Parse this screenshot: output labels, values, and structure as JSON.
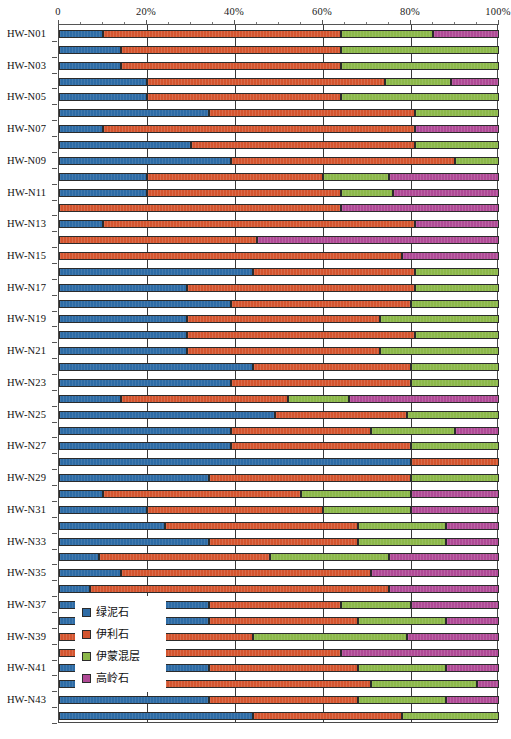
{
  "chart_data": {
    "type": "bar",
    "orientation": "horizontal",
    "stacked": true,
    "stacked_normalized": true,
    "title": "",
    "xlabel": "",
    "ylabel": "",
    "xlim": [
      0,
      100
    ],
    "grid": true,
    "legend_position": "inside-bottom-left",
    "x_tick_labels": [
      "0",
      "20%",
      "40%",
      "60%",
      "80%",
      "100%"
    ],
    "x_tick_values": [
      0,
      20,
      40,
      60,
      80,
      100
    ],
    "x_minor_tick_values": [
      5,
      10,
      15,
      25,
      30,
      35,
      45,
      50,
      55,
      65,
      70,
      75,
      85,
      90,
      95
    ],
    "y_tick_labels": [
      "HW-N01",
      "HW-N03",
      "HW-N05",
      "HW-N07",
      "HW-N09",
      "HW-N11",
      "HW-N13",
      "HW-N15",
      "HW-N17",
      "HW-N19",
      "HW-N21",
      "HW-N23",
      "HW-N25",
      "HW-N27",
      "HW-N29",
      "HW-N31",
      "HW-N33",
      "HW-N35",
      "HW-N37",
      "HW-N39",
      "HW-N41",
      "HW-N43"
    ],
    "series": [
      {
        "name": "绿泥石",
        "color": "#2e6ca6"
      },
      {
        "name": "伊利石",
        "color": "#d4552f"
      },
      {
        "name": "伊蒙混层",
        "color": "#8cb84a"
      },
      {
        "name": "高岭石",
        "color": "#b04a96"
      }
    ],
    "samples": [
      {
        "label": "HW-N01",
        "values": [
          10,
          54,
          21,
          15
        ]
      },
      {
        "label": "",
        "values": [
          14,
          50,
          36,
          0
        ]
      },
      {
        "label": "HW-N03",
        "values": [
          14,
          50,
          36,
          0
        ]
      },
      {
        "label": "",
        "values": [
          20,
          54,
          15,
          11
        ]
      },
      {
        "label": "HW-N05",
        "values": [
          20,
          44,
          36,
          0
        ]
      },
      {
        "label": "",
        "values": [
          34,
          47,
          19,
          0
        ]
      },
      {
        "label": "HW-N07",
        "values": [
          10,
          71,
          0,
          19
        ]
      },
      {
        "label": "",
        "values": [
          30,
          51,
          19,
          0
        ]
      },
      {
        "label": "HW-N09",
        "values": [
          39,
          51,
          10,
          0
        ]
      },
      {
        "label": "",
        "values": [
          20,
          40,
          15,
          25
        ]
      },
      {
        "label": "HW-N11",
        "values": [
          20,
          44,
          12,
          24
        ]
      },
      {
        "label": "",
        "values": [
          0,
          64,
          0,
          36
        ]
      },
      {
        "label": "HW-N13",
        "values": [
          10,
          71,
          0,
          19
        ]
      },
      {
        "label": "",
        "values": [
          0,
          45,
          0,
          55
        ]
      },
      {
        "label": "HW-N15",
        "values": [
          0,
          78,
          0,
          22
        ]
      },
      {
        "label": "",
        "values": [
          44,
          37,
          19,
          0
        ]
      },
      {
        "label": "HW-N17",
        "values": [
          29,
          52,
          19,
          0
        ]
      },
      {
        "label": "",
        "values": [
          39,
          41,
          20,
          0
        ]
      },
      {
        "label": "HW-N19",
        "values": [
          29,
          44,
          27,
          0
        ]
      },
      {
        "label": "",
        "values": [
          29,
          52,
          19,
          0
        ]
      },
      {
        "label": "HW-N21",
        "values": [
          29,
          44,
          27,
          0
        ]
      },
      {
        "label": "",
        "values": [
          44,
          36,
          20,
          0
        ]
      },
      {
        "label": "HW-N23",
        "values": [
          39,
          41,
          20,
          0
        ]
      },
      {
        "label": "",
        "values": [
          14,
          38,
          14,
          34
        ]
      },
      {
        "label": "HW-N25",
        "values": [
          49,
          30,
          21,
          0
        ]
      },
      {
        "label": "",
        "values": [
          39,
          32,
          19,
          10
        ]
      },
      {
        "label": "HW-N27",
        "values": [
          39,
          41,
          20,
          0
        ]
      },
      {
        "label": "",
        "values": [
          80,
          20,
          0,
          0
        ]
      },
      {
        "label": "HW-N29",
        "values": [
          34,
          46,
          20,
          0
        ]
      },
      {
        "label": "",
        "values": [
          10,
          45,
          25,
          20
        ]
      },
      {
        "label": "HW-N31",
        "values": [
          20,
          40,
          20,
          20
        ]
      },
      {
        "label": "",
        "values": [
          24,
          44,
          20,
          12
        ]
      },
      {
        "label": "HW-N33",
        "values": [
          34,
          34,
          20,
          12
        ]
      },
      {
        "label": "",
        "values": [
          9,
          39,
          27,
          25
        ]
      },
      {
        "label": "HW-N35",
        "values": [
          14,
          57,
          0,
          29
        ]
      },
      {
        "label": "",
        "values": [
          7,
          68,
          0,
          25
        ]
      },
      {
        "label": "HW-N37",
        "values": [
          34,
          30,
          16,
          20
        ]
      },
      {
        "label": "",
        "values": [
          34,
          34,
          20,
          12
        ]
      },
      {
        "label": "HW-N39",
        "values": [
          0,
          44,
          35,
          21
        ]
      },
      {
        "label": "",
        "values": [
          0,
          64,
          0,
          36
        ]
      },
      {
        "label": "HW-N41",
        "values": [
          34,
          34,
          20,
          12
        ]
      },
      {
        "label": "",
        "values": [
          9,
          62,
          24,
          5
        ]
      },
      {
        "label": "HW-N43",
        "values": [
          34,
          34,
          20,
          12
        ]
      },
      {
        "label": "",
        "values": [
          44,
          34,
          22,
          0
        ]
      }
    ]
  },
  "legend": {
    "items": [
      {
        "label": "绿泥石",
        "color": "#2e6ca6"
      },
      {
        "label": "伊利石",
        "color": "#d4552f"
      },
      {
        "label": "伊蒙混层",
        "color": "#8cb84a"
      },
      {
        "label": "高岭石",
        "color": "#b04a96"
      }
    ]
  },
  "caption": ""
}
